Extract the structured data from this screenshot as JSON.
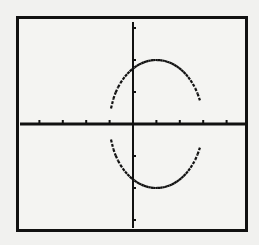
{
  "chart_data": {
    "type": "line",
    "title": "",
    "xlabel": "",
    "ylabel": "",
    "xlim": [
      -4.7,
      4.7
    ],
    "ylim": [
      -3.1,
      3.1
    ],
    "xscl": 1,
    "yscl": 1,
    "grid": false,
    "legend": null,
    "x_ticks": [
      -4,
      -3,
      -2,
      -1,
      1,
      2,
      3,
      4
    ],
    "y_ticks": [
      -3,
      -2,
      -1,
      1,
      2,
      3
    ],
    "series": [
      {
        "name": "ellipse upper half",
        "equation": "y = sqrt(4 - (x-1)^2)",
        "domain": [
          -1,
          3
        ]
      },
      {
        "name": "ellipse lower half",
        "equation": "y = -sqrt(4 - (x-1)^2)",
        "domain": [
          -1,
          3
        ]
      }
    ],
    "shape": {
      "kind": "ellipse",
      "center": [
        1,
        0
      ],
      "semi_axis_x": 2,
      "semi_axis_y": 2
    }
  },
  "colors": {
    "background": "#f1f1ef",
    "ink": "#111111"
  }
}
